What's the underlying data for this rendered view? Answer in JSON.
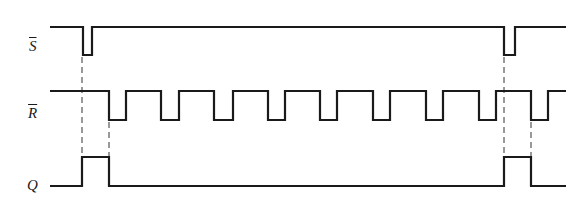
{
  "diagram": {
    "type": "timing-diagram",
    "colors": {
      "line": "#1a1a1a",
      "guide": "#333333",
      "background": "#ffffff"
    },
    "signals": [
      {
        "id": "s_bar",
        "label": "S",
        "overbar": true,
        "y_high": 27,
        "y_low": 55,
        "x_start": 50,
        "x_end": 566,
        "initial": "high",
        "transitions": [
          83,
          92,
          504,
          515
        ]
      },
      {
        "id": "r_bar",
        "label": "R",
        "overbar": true,
        "y_high": 91,
        "y_low": 120,
        "x_start": 50,
        "x_end": 566,
        "initial": "high",
        "transitions": [
          109,
          126,
          161,
          179,
          214,
          233,
          268,
          285,
          320,
          337,
          373,
          390,
          426,
          443,
          479,
          496,
          531,
          548
        ]
      },
      {
        "id": "q",
        "label": "Q",
        "overbar": false,
        "y_high": 157,
        "y_low": 186,
        "x_start": 50,
        "x_end": 566,
        "initial": "low",
        "transitions": [
          82,
          109,
          504,
          531
        ]
      }
    ],
    "guides": [
      {
        "x": 82,
        "y1": 57,
        "y2": 157
      },
      {
        "x": 109,
        "y1": 122,
        "y2": 157
      },
      {
        "x": 504,
        "y1": 57,
        "y2": 157
      },
      {
        "x": 531,
        "y1": 122,
        "y2": 157
      }
    ]
  }
}
